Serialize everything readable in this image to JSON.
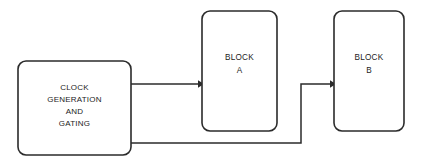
{
  "diagram": {
    "background_color": "#ffffff",
    "line_color": "#2b2b2b",
    "text_color": "#1c1c1c",
    "blocks": [
      {
        "id": "clock-generation-and-gating",
        "lines": [
          "CLOCK",
          "GENERATION",
          "AND",
          "GATING"
        ],
        "x": 18,
        "y": 61,
        "width": 113,
        "height": 94,
        "radius": 8
      },
      {
        "id": "block-a",
        "lines": [
          "BLOCK",
          "A"
        ],
        "x": 202,
        "y": 11,
        "width": 75,
        "height": 120,
        "radius": 8
      },
      {
        "id": "block-b",
        "lines": [
          "BLOCK",
          "B"
        ],
        "x": 334,
        "y": 11,
        "width": 70,
        "height": 120,
        "radius": 8
      }
    ],
    "connections": [
      {
        "id": "clock-to-block-a",
        "from": "clock-generation-and-gating",
        "to": "block-a",
        "path": "M 131 84 L 198 84",
        "arrow": "M 198 80.2 L 198 87.8 L 204 84 Z"
      },
      {
        "id": "clock-to-block-b",
        "from": "clock-generation-and-gating",
        "to": "block-b",
        "path": "M 131 143 L 301 143 L 301 84 L 330 84",
        "arrow": "M 330 80.2 L 330 87.8 L 336 84 Z"
      }
    ]
  }
}
